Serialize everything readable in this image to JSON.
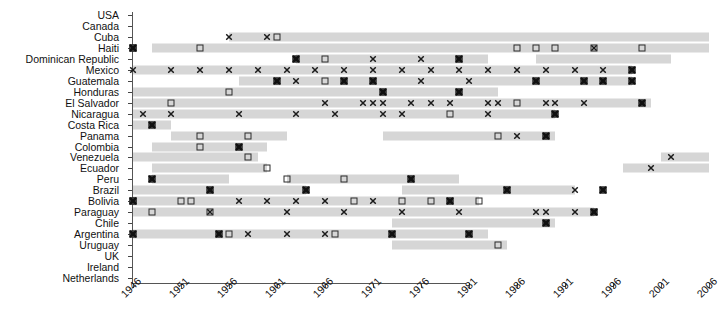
{
  "chart_data": {
    "type": "scatter",
    "title": "",
    "xlabel": "",
    "ylabel": "",
    "xlim": [
      1945,
      2008
    ],
    "ylim_categories": 24,
    "grid": false,
    "legend": [],
    "xticks": [
      1946,
      1951,
      1956,
      1961,
      1966,
      1971,
      1976,
      1981,
      1986,
      1991,
      1996,
      2001,
      2006
    ],
    "categories": [
      "USA",
      "Canada",
      "Cuba",
      "Haiti",
      "Dominican Republic",
      "Mexico",
      "Guatemala",
      "Honduras",
      "El Salvador",
      "Nicaragua",
      "Costa Rica",
      "Panama",
      "Colombia",
      "Venezuela",
      "Ecuador",
      "Peru",
      "Brazil",
      "Bolivia",
      "Paraguay",
      "Chile",
      "Argentina",
      "Uruguay",
      "UK",
      "Ireland",
      "Netherlands"
    ],
    "marker_types": {
      "x": "x-mark",
      "square": "open-square",
      "both": "filled-hatched-square"
    },
    "series": [
      {
        "country": "USA",
        "bands": [],
        "x": [],
        "square": [],
        "both": []
      },
      {
        "country": "Canada",
        "bands": [],
        "x": [],
        "square": [],
        "both": []
      },
      {
        "country": "Cuba",
        "bands": [
          [
            1956,
            2006
          ]
        ],
        "x": [
          1956,
          1960
        ],
        "square": [
          1961
        ],
        "both": []
      },
      {
        "country": "Haiti",
        "bands": [
          [
            1948,
            2006
          ]
        ],
        "x": [
          1994
        ],
        "square": [
          1946,
          1953,
          1986,
          1988,
          1990,
          1994,
          1999
        ],
        "both": [
          1946
        ]
      },
      {
        "country": "Dominican Republic",
        "bands": [
          [
            1963,
            1983
          ],
          [
            1988,
            2002
          ]
        ],
        "x": [
          1971,
          1976
        ],
        "square": [
          1966
        ],
        "both": [
          1963,
          1980
        ]
      },
      {
        "country": "Mexico",
        "bands": [
          [
            1946,
            1998
          ]
        ],
        "x": [
          1946,
          1950,
          1953,
          1956,
          1959,
          1962,
          1965,
          1968,
          1971,
          1974,
          1977,
          1980,
          1983,
          1986,
          1989,
          1992,
          1995
        ],
        "square": [],
        "both": [
          1998
        ]
      },
      {
        "country": "Guatemala",
        "bands": [
          [
            1957,
            1998
          ]
        ],
        "x": [
          1963,
          1976,
          1981
        ],
        "square": [
          1966
        ],
        "both": [
          1961,
          1968,
          1971,
          1988,
          1993,
          1995,
          1998
        ]
      },
      {
        "country": "Honduras",
        "bands": [
          [
            1946,
            1984
          ]
        ],
        "x": [],
        "square": [
          1956
        ],
        "both": [
          1972,
          1980
        ]
      },
      {
        "country": "El Salvador",
        "bands": [
          [
            1946,
            2000
          ]
        ],
        "x": [
          1966,
          1970,
          1971,
          1972,
          1975,
          1977,
          1979,
          1983,
          1984,
          1989,
          1990,
          1993
        ],
        "square": [
          1950,
          1986
        ],
        "both": [
          1999
        ]
      },
      {
        "country": "Nicaragua",
        "bands": [
          [
            1946,
            1990
          ]
        ],
        "x": [
          1947,
          1950,
          1957,
          1963,
          1967,
          1972,
          1974,
          1983
        ],
        "square": [
          1979
        ],
        "both": [
          1990
        ]
      },
      {
        "country": "Costa Rica",
        "bands": [
          [
            1946,
            1950
          ]
        ],
        "x": [],
        "square": [],
        "both": [
          1948
        ]
      },
      {
        "country": "Panama",
        "bands": [
          [
            1950,
            1962
          ],
          [
            1972,
            1990
          ]
        ],
        "x": [
          1986
        ],
        "square": [
          1953,
          1958,
          1984
        ],
        "both": [
          1989
        ]
      },
      {
        "country": "Colombia",
        "bands": [
          [
            1948,
            1960
          ]
        ],
        "x": [],
        "square": [
          1953
        ],
        "both": [
          1957
        ]
      },
      {
        "country": "Venezuela",
        "bands": [
          [
            1946,
            1959
          ],
          [
            2001,
            2006
          ]
        ],
        "x": [
          2002
        ],
        "square": [
          1958
        ],
        "both": []
      },
      {
        "country": "Ecuador",
        "bands": [
          [
            1948,
            1960
          ],
          [
            1997,
            2006
          ]
        ],
        "x": [
          2000
        ],
        "square": [
          1960
        ],
        "both": []
      },
      {
        "country": "Peru",
        "bands": [
          [
            1948,
            1956
          ],
          [
            1962,
            1980
          ]
        ],
        "x": [],
        "square": [
          1962,
          1968
        ],
        "both": [
          1948,
          1975
        ]
      },
      {
        "country": "Brazil",
        "bands": [
          [
            1946,
            1964
          ],
          [
            1974,
            1992
          ]
        ],
        "x": [
          1992
        ],
        "both": [
          1954,
          1964,
          1985,
          1995
        ],
        "square": []
      },
      {
        "country": "Bolivia",
        "bands": [
          [
            1946,
            1982
          ]
        ],
        "x": [
          1946,
          1957,
          1960,
          1963,
          1966,
          1971
        ],
        "square": [
          1946,
          1951,
          1952,
          1969,
          1974,
          1977,
          1982
        ],
        "both": [
          1946,
          1979
        ]
      },
      {
        "country": "Paraguay",
        "bands": [
          [
            1946,
            1994
          ]
        ],
        "x": [
          1954,
          1962,
          1968,
          1974,
          1980,
          1988,
          1989,
          1992
        ],
        "square": [
          1948,
          1954
        ],
        "both": [
          1994
        ]
      },
      {
        "country": "Chile",
        "bands": [
          [
            1973,
            1990
          ]
        ],
        "x": [],
        "square": [],
        "both": [
          1989
        ]
      },
      {
        "country": "Argentina",
        "bands": [
          [
            1946,
            1983
          ]
        ],
        "x": [
          1955,
          1958,
          1962,
          1966
        ],
        "square": [
          1956,
          1967
        ],
        "both": [
          1946,
          1955,
          1973,
          1981
        ]
      },
      {
        "country": "Uruguay",
        "bands": [
          [
            1973,
            1985
          ]
        ],
        "x": [],
        "square": [
          1984
        ],
        "both": []
      },
      {
        "country": "UK",
        "bands": [],
        "x": [],
        "square": [],
        "both": []
      },
      {
        "country": "Ireland",
        "bands": [],
        "x": [],
        "square": [],
        "both": []
      },
      {
        "country": "Netherlands",
        "bands": [],
        "x": [],
        "square": [],
        "both": []
      }
    ]
  },
  "axis": {
    "x_tick_labels": [
      "1946",
      "1951",
      "1956",
      "1961",
      "1966",
      "1971",
      "1976",
      "1981",
      "1986",
      "1991",
      "1996",
      "2001",
      "2006"
    ],
    "y_tick_labels": [
      "USA",
      "Canada",
      "Cuba",
      "Haiti",
      "Dominican Republic",
      "Mexico",
      "Guatemala",
      "Honduras",
      "El Salvador",
      "Nicaragua",
      "Costa Rica",
      "Panama",
      "Colombia",
      "Venezuela",
      "Ecuador",
      "Peru",
      "Brazil",
      "Bolivia",
      "Paraguay",
      "Chile",
      "Argentina",
      "Uruguay",
      "UK",
      "Ireland",
      "Netherlands"
    ]
  },
  "colors": {
    "band": "#d6d6d6",
    "marker": "#1a1a1a",
    "axis": "#555555",
    "text": "#111111",
    "background": "#ffffff"
  }
}
